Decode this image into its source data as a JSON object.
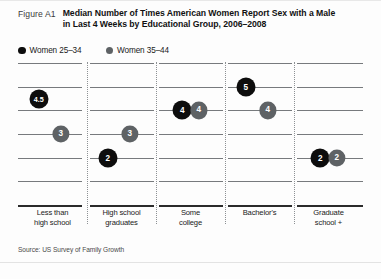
{
  "figure": {
    "label": "Figure A1",
    "title_line1": "Median Number of Times American Women Report Sex with a Male",
    "title_line2": "in Last 4 Weeks by Educational Group, 2006–2008",
    "source": "Source:  US Survey of Family Growth"
  },
  "legend": {
    "items": [
      {
        "label": "Women 25–34",
        "color": "#0d0d0d",
        "icon": "filled-circle-icon"
      },
      {
        "label": "Women 35–44",
        "color": "#5e6265",
        "icon": "filled-circle-icon"
      }
    ]
  },
  "chart_data": {
    "type": "scatter",
    "title": "Median Number of Times American Women Report Sex with a Male in Last 4 Weeks by Educational Group, 2006–2008",
    "xlabel": "",
    "ylabel": "",
    "ylim": [
      0,
      6
    ],
    "grid": true,
    "gridlines": [
      6,
      5,
      4,
      3,
      2,
      1,
      0
    ],
    "legend_position": "top-left",
    "categories": [
      "Less than high school",
      "High school graduates",
      "Some college",
      "Bachelor's",
      "Graduate school +"
    ],
    "category_lines": [
      [
        "Less than",
        "high school"
      ],
      [
        "High school",
        "graduates"
      ],
      [
        "Some",
        "college"
      ],
      [
        "Bachelor's",
        ""
      ],
      [
        "Graduate",
        "school +"
      ]
    ],
    "series": [
      {
        "name": "Women 25–34",
        "color": "#0d0d0d",
        "values": [
          4.5,
          2,
          4,
          5,
          2
        ],
        "labels": [
          "4.5",
          "2",
          "4",
          "5",
          "2"
        ]
      },
      {
        "name": "Women 35–44",
        "color": "#5e6265",
        "values": [
          3,
          3,
          4,
          4,
          2
        ],
        "labels": [
          "3",
          "3",
          "4",
          "4",
          "2"
        ]
      }
    ]
  }
}
